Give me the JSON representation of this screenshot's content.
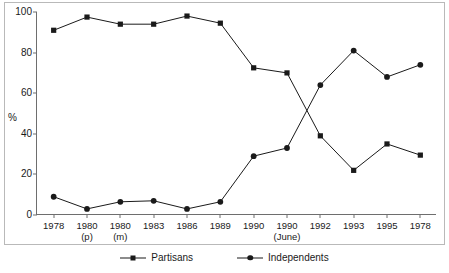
{
  "chart_data": {
    "type": "line",
    "title": "",
    "subtitle": "",
    "xlabel": "",
    "ylabel": "%",
    "ylim": [
      0,
      100
    ],
    "yticks": [
      0,
      20,
      40,
      60,
      80,
      100
    ],
    "grid": false,
    "legend_position": "bottom-center",
    "categories": [
      "1978",
      "1980 (p)",
      "1980 (m)",
      "1983",
      "1986",
      "1989",
      "1990",
      "1990 (June)",
      "1992",
      "1993",
      "1995",
      "1978"
    ],
    "category_labels": [
      {
        "main": "1978",
        "sub": ""
      },
      {
        "main": "1980",
        "sub": "(p)"
      },
      {
        "main": "1980",
        "sub": "(m)"
      },
      {
        "main": "1983",
        "sub": ""
      },
      {
        "main": "1986",
        "sub": ""
      },
      {
        "main": "1989",
        "sub": ""
      },
      {
        "main": "1990",
        "sub": ""
      },
      {
        "main": "1990",
        "sub": "(June)"
      },
      {
        "main": "1992",
        "sub": ""
      },
      {
        "main": "1993",
        "sub": ""
      },
      {
        "main": "1995",
        "sub": ""
      },
      {
        "main": "1978",
        "sub": ""
      }
    ],
    "series": [
      {
        "name": "Partisans",
        "marker": "square",
        "color": "#1a1a1a",
        "values": [
          91,
          97.5,
          94,
          94,
          98,
          94.5,
          72.5,
          70,
          39,
          22,
          35,
          29.5
        ]
      },
      {
        "name": "Independents",
        "marker": "circle",
        "color": "#1a1a1a",
        "values": [
          9,
          3,
          6.5,
          7,
          3,
          6.5,
          29,
          33,
          64,
          81,
          68,
          74
        ]
      }
    ]
  },
  "legend": {
    "entries": [
      {
        "label": "Partisans",
        "marker": "square-marker-icon"
      },
      {
        "label": "Independents",
        "marker": "circle-marker-icon"
      }
    ]
  },
  "colors": {
    "ink": "#1a1a1a",
    "axis": "#6e6e6e",
    "frame": "#b9b9b9",
    "background": "#ffffff"
  }
}
